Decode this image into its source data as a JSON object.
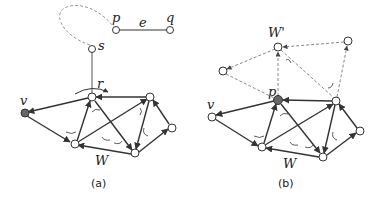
{
  "figure": {
    "panels": [
      {
        "id": "a",
        "caption": "(a)",
        "labels": {
          "p": "p",
          "q": "q",
          "e": "e",
          "s": "s",
          "r": "r",
          "v": "v",
          "W": "W"
        }
      },
      {
        "id": "b",
        "caption": "(b)",
        "labels": {
          "Wprime": "W'",
          "p": "p",
          "v": "v",
          "W": "W"
        }
      }
    ],
    "colors": {
      "edge": "#333333",
      "dashed": "#888888",
      "node_fill": "#ffffff",
      "node_filled": "#666666"
    }
  }
}
